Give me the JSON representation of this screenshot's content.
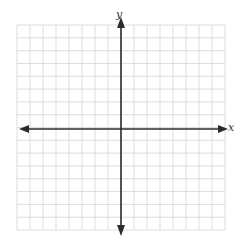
{
  "diagram": {
    "type": "coordinate-plane",
    "axes": {
      "x_label": "x",
      "y_label": "y",
      "x_arrows": "both",
      "y_arrows": "both"
    },
    "grid": {
      "columns": 16,
      "rows": 16,
      "origin_column": 8,
      "origin_row": 8,
      "tick_labels": false
    },
    "colors": {
      "grid_line": "#d4d4d4",
      "axis_line": "#2b2b2b",
      "background": "#ffffff",
      "label": "#333333"
    }
  }
}
